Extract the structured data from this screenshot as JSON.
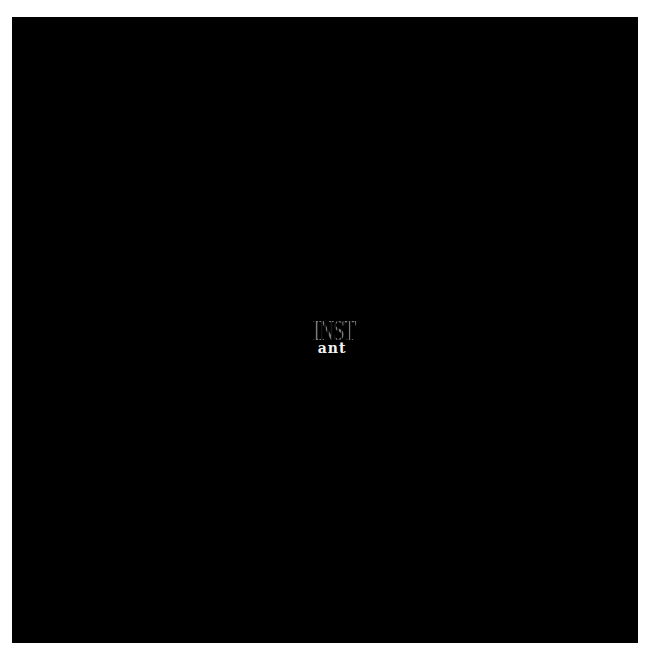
{
  "background": {
    "color": "#000000",
    "frame_color": "#ffffff"
  },
  "logo": {
    "top_text": "INST",
    "bottom_text": "ant",
    "top_color": "#7a7a7a",
    "bottom_color": "#f2f2f2"
  }
}
